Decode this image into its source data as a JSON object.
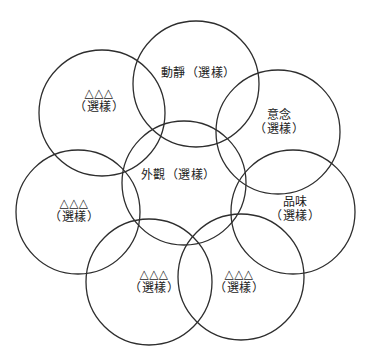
{
  "figure": {
    "width": 368,
    "height": 360,
    "background_color": "#ffffff",
    "stroke_color": "#2e2e2e",
    "stroke_width": 1.3,
    "text_color": "#222222"
  },
  "nodes": [
    {
      "name": "appearance",
      "label_lines": [
        "外觀（選樣）"
      ],
      "circle": {
        "cx": 184,
        "cy": 183,
        "r": 62
      },
      "label_pos": {
        "x": 178,
        "y": 175
      }
    },
    {
      "name": "motion",
      "label_lines": [
        "動靜（選樣）"
      ],
      "circle": {
        "cx": 196,
        "cy": 84,
        "r": 63
      },
      "label_pos": {
        "x": 198,
        "y": 73
      }
    },
    {
      "name": "idea",
      "label_lines": [
        "意念",
        "（選樣）"
      ],
      "circle": {
        "cx": 278,
        "cy": 132,
        "r": 62
      },
      "label_pos": {
        "x": 279,
        "y": 122
      }
    },
    {
      "name": "taste",
      "label_lines": [
        "品味",
        "（選樣）"
      ],
      "circle": {
        "cx": 293,
        "cy": 212,
        "r": 62
      },
      "label_pos": {
        "x": 295,
        "y": 209
      }
    },
    {
      "name": "placeholder-bottom-right",
      "label_lines": [
        "△△△",
        "（選樣）"
      ],
      "circle": {
        "cx": 241,
        "cy": 277,
        "r": 63
      },
      "label_pos": {
        "x": 239,
        "y": 281
      }
    },
    {
      "name": "placeholder-bottom-left",
      "label_lines": [
        "△△△",
        "（選樣）"
      ],
      "circle": {
        "cx": 149,
        "cy": 282,
        "r": 63
      },
      "label_pos": {
        "x": 154,
        "y": 281
      }
    },
    {
      "name": "placeholder-left",
      "label_lines": [
        "△△△",
        "（選樣）"
      ],
      "circle": {
        "cx": 78,
        "cy": 212,
        "r": 62
      },
      "label_pos": {
        "x": 74,
        "y": 210
      }
    },
    {
      "name": "placeholder-upper-left",
      "label_lines": [
        "△△△",
        "（選樣）"
      ],
      "circle": {
        "cx": 102,
        "cy": 113,
        "r": 63
      },
      "label_pos": {
        "x": 99,
        "y": 100
      }
    }
  ]
}
